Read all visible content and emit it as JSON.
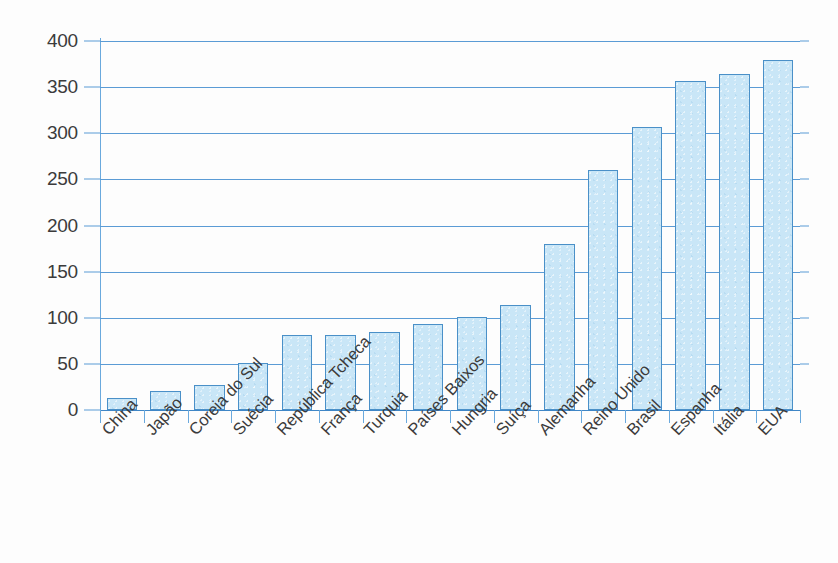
{
  "chart_data": {
    "type": "bar",
    "title": "",
    "subtitle": "",
    "xlabel": "",
    "ylabel": "",
    "ylim": [
      0,
      400
    ],
    "ytick_step": 50,
    "yticks": [
      0,
      50,
      100,
      150,
      200,
      250,
      300,
      350,
      400
    ],
    "ytick_labels": [
      "0",
      "50",
      "100",
      "150",
      "200",
      "250",
      "300",
      "350",
      "400"
    ],
    "grid": true,
    "legend": false,
    "legend_position": "none",
    "categories": [
      "China",
      "Japão",
      "Coreia do Sul",
      "Suécia",
      "República Tcheca",
      "França",
      "Turquia",
      "Países Baixos",
      "Hungria",
      "Suíça",
      "Alemanha",
      "Reino Unido",
      "Brasil",
      "Espanha",
      "Itália",
      "EUA"
    ],
    "values": [
      13,
      21,
      27,
      51,
      81,
      81,
      85,
      93,
      101,
      114,
      180,
      260,
      307,
      357,
      364,
      379
    ],
    "series": [
      {
        "name": "",
        "values": [
          13,
          21,
          27,
          51,
          81,
          81,
          85,
          93,
          101,
          114,
          180,
          260,
          307,
          357,
          364,
          379
        ]
      }
    ],
    "annotations": []
  },
  "style": {
    "bar_fill": "#c9e6f7",
    "bar_border": "#4a90c8",
    "grid_color": "#5b9bd5",
    "axis_color": "#6aa9dd",
    "text_color": "#3b3b3b",
    "background": "#fdfdfd"
  }
}
